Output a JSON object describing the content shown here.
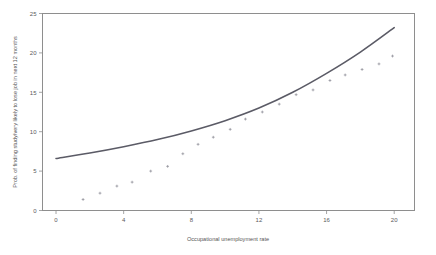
{
  "figure": {
    "background_color": "#ffffff",
    "frame_color": "#8e8e8e",
    "line_color": "#5b5b66",
    "point_color": "#8a8a93"
  },
  "axes": {
    "x_title": "Occupational unemployment rate",
    "y_title": "Prob. of finding study/very likely to lose job in next 12 months",
    "x_ticks": [
      "0",
      "4",
      "8",
      "12",
      "16",
      "20"
    ],
    "y_ticks": [
      "0",
      "5",
      "10",
      "15",
      "20",
      "25"
    ]
  },
  "chart_data": {
    "type": "scatter",
    "title": "",
    "xlabel": "Occupational unemployment rate",
    "ylabel": "Prob. of finding study/very likely to lose job in next 12 months",
    "xlim": [
      -0.8,
      21.2
    ],
    "ylim": [
      0,
      25
    ],
    "xticks": [
      0,
      4,
      8,
      12,
      16,
      20
    ],
    "yticks": [
      0,
      5,
      10,
      15,
      20,
      25
    ],
    "grid": false,
    "legend": "none",
    "series": [
      {
        "name": "Fitted curve",
        "type": "line",
        "x": [
          0,
          2,
          4,
          6,
          8,
          10,
          12,
          14,
          16,
          18,
          20
        ],
        "y": [
          6.6,
          7.3,
          8.1,
          9.0,
          10.1,
          11.4,
          13.0,
          15.0,
          17.4,
          20.1,
          23.2
        ]
      },
      {
        "name": "Observed occupations",
        "type": "scatter",
        "points": [
          {
            "x": 1.6,
            "y": 1.4
          },
          {
            "x": 2.6,
            "y": 2.2
          },
          {
            "x": 3.6,
            "y": 3.1
          },
          {
            "x": 4.5,
            "y": 3.6
          },
          {
            "x": 5.6,
            "y": 5.0
          },
          {
            "x": 6.6,
            "y": 5.6
          },
          {
            "x": 7.5,
            "y": 7.2
          },
          {
            "x": 8.4,
            "y": 8.4
          },
          {
            "x": 9.3,
            "y": 9.3
          },
          {
            "x": 10.3,
            "y": 10.3
          },
          {
            "x": 11.2,
            "y": 11.6
          },
          {
            "x": 12.2,
            "y": 12.5
          },
          {
            "x": 13.2,
            "y": 13.5
          },
          {
            "x": 14.2,
            "y": 14.7
          },
          {
            "x": 15.2,
            "y": 15.3
          },
          {
            "x": 16.2,
            "y": 16.5
          },
          {
            "x": 17.1,
            "y": 17.2
          },
          {
            "x": 18.1,
            "y": 17.9
          },
          {
            "x": 19.1,
            "y": 18.6
          },
          {
            "x": 19.9,
            "y": 19.6
          }
        ]
      }
    ]
  }
}
